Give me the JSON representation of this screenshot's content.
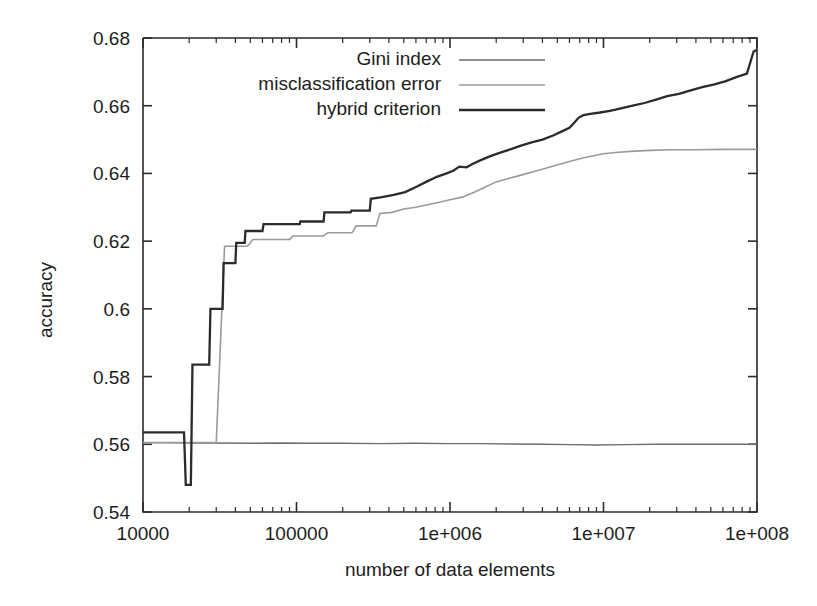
{
  "chart_data": {
    "type": "line",
    "title": "",
    "xlabel": "number of data elements",
    "ylabel": "accuracy",
    "xscale": "log",
    "yscale": "linear",
    "xlim": [
      10000,
      100000000
    ],
    "ylim": [
      0.54,
      0.68
    ],
    "grid": false,
    "legend_position": "top-center",
    "xticks": [
      10000,
      100000,
      1000000,
      10000000,
      100000000
    ],
    "xtick_labels": [
      "10000",
      "100000",
      "1e+006",
      "1e+007",
      "1e+008"
    ],
    "yticks": [
      0.54,
      0.56,
      0.58,
      0.6,
      0.62,
      0.64,
      0.66,
      0.68
    ],
    "ytick_labels": [
      "0.54",
      "0.56",
      "0.58",
      "0.6",
      "0.62",
      "0.64",
      "0.66",
      "0.68"
    ],
    "series": [
      {
        "name": "Gini index",
        "color": "#6e6e6e",
        "width": 1.4,
        "points": [
          [
            10000,
            0.5605
          ],
          [
            15000,
            0.5605
          ],
          [
            20000,
            0.5604
          ],
          [
            30000,
            0.5604
          ],
          [
            50000,
            0.5603
          ],
          [
            80000,
            0.5604
          ],
          [
            120000,
            0.5603
          ],
          [
            200000,
            0.5603
          ],
          [
            350000,
            0.5602
          ],
          [
            600000,
            0.5603
          ],
          [
            1000000,
            0.5602
          ],
          [
            1600000,
            0.5602
          ],
          [
            2500000,
            0.5601
          ],
          [
            4000000,
            0.56
          ],
          [
            6000000,
            0.5599
          ],
          [
            9000000,
            0.5598
          ],
          [
            14000000,
            0.5599
          ],
          [
            22000000,
            0.56
          ],
          [
            35000000,
            0.56
          ],
          [
            55000000,
            0.56
          ],
          [
            80000000,
            0.56
          ],
          [
            100000000,
            0.56
          ]
        ]
      },
      {
        "name": "misclassification error",
        "color": "#9a9a9a",
        "width": 1.6,
        "points": [
          [
            10000,
            0.5605
          ],
          [
            19000,
            0.5605
          ],
          [
            19500,
            0.5605
          ],
          [
            21000,
            0.5605
          ],
          [
            30000,
            0.5605
          ],
          [
            34000,
            0.6185
          ],
          [
            48000,
            0.6185
          ],
          [
            52000,
            0.6205
          ],
          [
            90000,
            0.6205
          ],
          [
            95000,
            0.6215
          ],
          [
            150000,
            0.6215
          ],
          [
            160000,
            0.6225
          ],
          [
            230000,
            0.6225
          ],
          [
            245000,
            0.6245
          ],
          [
            330000,
            0.6245
          ],
          [
            350000,
            0.6282
          ],
          [
            420000,
            0.6285
          ],
          [
            500000,
            0.6295
          ],
          [
            600000,
            0.63
          ],
          [
            700000,
            0.6307
          ],
          [
            850000,
            0.6315
          ],
          [
            1000000,
            0.6322
          ],
          [
            1200000,
            0.633
          ],
          [
            1450000,
            0.6345
          ],
          [
            1700000,
            0.636
          ],
          [
            2000000,
            0.6375
          ],
          [
            2400000,
            0.6385
          ],
          [
            2900000,
            0.6395
          ],
          [
            3500000,
            0.6405
          ],
          [
            4200000,
            0.6415
          ],
          [
            5000000,
            0.6425
          ],
          [
            6000000,
            0.6435
          ],
          [
            7200000,
            0.6445
          ],
          [
            8600000,
            0.6452
          ],
          [
            10000000,
            0.6458
          ],
          [
            12000000,
            0.6462
          ],
          [
            15000000,
            0.6465
          ],
          [
            20000000,
            0.6468
          ],
          [
            28000000,
            0.647
          ],
          [
            40000000,
            0.647
          ],
          [
            60000000,
            0.6471
          ],
          [
            80000000,
            0.6471
          ],
          [
            100000000,
            0.6471
          ]
        ]
      },
      {
        "name": "hybrid criterion",
        "color": "#2b2b2b",
        "width": 2.3,
        "points": [
          [
            10000,
            0.5635
          ],
          [
            18500,
            0.5635
          ],
          [
            19000,
            0.548
          ],
          [
            20500,
            0.548
          ],
          [
            21000,
            0.5835
          ],
          [
            27000,
            0.5835
          ],
          [
            27500,
            0.6
          ],
          [
            33000,
            0.6
          ],
          [
            33500,
            0.6135
          ],
          [
            40000,
            0.6135
          ],
          [
            40500,
            0.6195
          ],
          [
            46000,
            0.6195
          ],
          [
            46500,
            0.623
          ],
          [
            60000,
            0.623
          ],
          [
            61000,
            0.625
          ],
          [
            105000,
            0.625
          ],
          [
            106000,
            0.6258
          ],
          [
            150000,
            0.6258
          ],
          [
            152000,
            0.6285
          ],
          [
            225000,
            0.6285
          ],
          [
            228000,
            0.629
          ],
          [
            300000,
            0.629
          ],
          [
            305000,
            0.6325
          ],
          [
            360000,
            0.633
          ],
          [
            430000,
            0.6337
          ],
          [
            510000,
            0.6345
          ],
          [
            600000,
            0.636
          ],
          [
            700000,
            0.6375
          ],
          [
            820000,
            0.639
          ],
          [
            950000,
            0.64
          ],
          [
            1050000,
            0.6408
          ],
          [
            1150000,
            0.642
          ],
          [
            1280000,
            0.6418
          ],
          [
            1400000,
            0.6428
          ],
          [
            1600000,
            0.644
          ],
          [
            1850000,
            0.6452
          ],
          [
            2150000,
            0.6462
          ],
          [
            2500000,
            0.6472
          ],
          [
            2900000,
            0.6482
          ],
          [
            3400000,
            0.6492
          ],
          [
            4000000,
            0.65
          ],
          [
            4700000,
            0.6512
          ],
          [
            5400000,
            0.6525
          ],
          [
            6000000,
            0.6535
          ],
          [
            6400000,
            0.6548
          ],
          [
            6900000,
            0.6565
          ],
          [
            7400000,
            0.6572
          ],
          [
            8200000,
            0.6576
          ],
          [
            9500000,
            0.658
          ],
          [
            11000000,
            0.6585
          ],
          [
            13000000,
            0.6592
          ],
          [
            15500000,
            0.66
          ],
          [
            18500000,
            0.6608
          ],
          [
            22000000,
            0.6618
          ],
          [
            26000000,
            0.6628
          ],
          [
            31000000,
            0.6635
          ],
          [
            37000000,
            0.6645
          ],
          [
            44000000,
            0.6655
          ],
          [
            52000000,
            0.6662
          ],
          [
            62000000,
            0.6672
          ],
          [
            74000000,
            0.6685
          ],
          [
            86000000,
            0.6695
          ],
          [
            95000000,
            0.676
          ],
          [
            100000000,
            0.6765
          ]
        ]
      }
    ],
    "annotations": []
  },
  "legend": {
    "items": [
      {
        "label": "Gini index",
        "color": "#6e6e6e"
      },
      {
        "label": "misclassification error",
        "color": "#9a9a9a"
      },
      {
        "label": "hybrid criterion",
        "color": "#2b2b2b"
      }
    ]
  },
  "axes": {
    "x_title": "number of data elements",
    "y_title": "accuracy"
  }
}
